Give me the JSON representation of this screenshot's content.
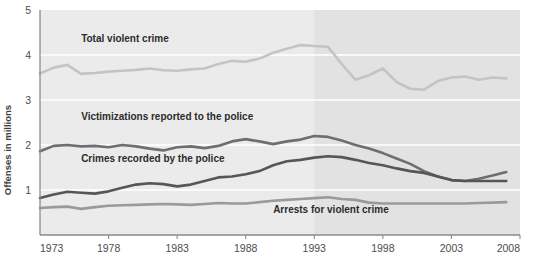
{
  "chart_data": {
    "type": "line",
    "title": "",
    "subtitle": "",
    "xlabel": "",
    "ylabel": "Offenses in millions",
    "xlim": [
      1973,
      2008
    ],
    "ylim": [
      0,
      5
    ],
    "grid": true,
    "grid_orientation": "horizontal",
    "legend_position": "inline-labels",
    "x_tick_labels": [
      "1973",
      "1978",
      "1983",
      "1988",
      "1993",
      "1998",
      "2003",
      "2008"
    ],
    "x_tick_values": [
      1973,
      1978,
      1983,
      1988,
      1993,
      1998,
      2003,
      2008
    ],
    "y_tick_labels": [
      "1",
      "2",
      "3",
      "4",
      "5"
    ],
    "y_tick_values": [
      1,
      2,
      3,
      4,
      5
    ],
    "shaded_region": {
      "from": 1993,
      "to": 2008,
      "color": "#e2e2e2"
    },
    "plot_background": "#ebebeb",
    "gridline_color": "#ffffff",
    "axis_color": "#8a8a8a",
    "x": [
      1973,
      1974,
      1975,
      1976,
      1977,
      1978,
      1979,
      1980,
      1981,
      1982,
      1983,
      1984,
      1985,
      1986,
      1987,
      1988,
      1989,
      1990,
      1991,
      1992,
      1993,
      1994,
      1995,
      1996,
      1997,
      1998,
      1999,
      2000,
      2001,
      2002,
      2003,
      2004,
      2005,
      2006,
      2007
    ],
    "series": [
      {
        "name": "Total violent crime",
        "color": "#c4c4c4",
        "label_x": 1976,
        "label_y": 4.3,
        "values": [
          3.59,
          3.72,
          3.78,
          3.58,
          3.6,
          3.63,
          3.65,
          3.67,
          3.7,
          3.66,
          3.65,
          3.68,
          3.7,
          3.8,
          3.87,
          3.85,
          3.92,
          4.05,
          4.14,
          4.22,
          4.2,
          4.18,
          3.8,
          3.45,
          3.55,
          3.7,
          3.4,
          3.25,
          3.23,
          3.42,
          3.5,
          3.52,
          3.45,
          3.5,
          3.48
        ]
      },
      {
        "name": "Victimizations reported to the police",
        "color": "#6e6e6e",
        "label_x": 1976,
        "label_y": 2.55,
        "values": [
          1.86,
          1.98,
          2.0,
          1.97,
          1.98,
          1.95,
          2.0,
          1.97,
          1.92,
          1.88,
          1.95,
          1.97,
          1.93,
          1.98,
          2.08,
          2.13,
          2.08,
          2.02,
          2.08,
          2.12,
          2.2,
          2.18,
          2.1,
          2.0,
          1.92,
          1.82,
          1.7,
          1.58,
          1.42,
          1.3,
          1.22,
          1.2,
          1.25,
          1.32,
          1.4
        ]
      },
      {
        "name": "Crimes recorded by the police",
        "color": "#565656",
        "label_x": 1976,
        "label_y": 1.62,
        "values": [
          0.82,
          0.9,
          0.96,
          0.94,
          0.92,
          0.97,
          1.05,
          1.12,
          1.15,
          1.13,
          1.08,
          1.12,
          1.2,
          1.28,
          1.3,
          1.35,
          1.42,
          1.55,
          1.64,
          1.67,
          1.72,
          1.75,
          1.73,
          1.67,
          1.6,
          1.55,
          1.48,
          1.42,
          1.38,
          1.3,
          1.22,
          1.2,
          1.2,
          1.2,
          1.2
        ]
      },
      {
        "name": "Arrests for violent crime",
        "color": "#9a9a9a",
        "label_x": 1990,
        "label_y": 0.48,
        "values": [
          0.6,
          0.62,
          0.63,
          0.58,
          0.62,
          0.65,
          0.66,
          0.67,
          0.68,
          0.69,
          0.68,
          0.67,
          0.69,
          0.71,
          0.7,
          0.7,
          0.73,
          0.76,
          0.78,
          0.8,
          0.82,
          0.84,
          0.8,
          0.78,
          0.72,
          0.7,
          0.7,
          0.7,
          0.7,
          0.7,
          0.7,
          0.7,
          0.71,
          0.72,
          0.73
        ]
      }
    ]
  }
}
